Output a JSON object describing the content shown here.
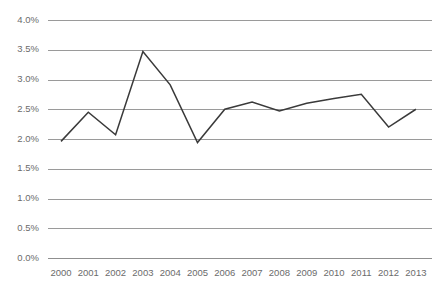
{
  "chart_data": {
    "type": "line",
    "title": "",
    "subtitle": "",
    "xlabel": "",
    "ylabel": "",
    "grid": true,
    "legend": false,
    "legend_position": "none",
    "line_color": "#3a3a3a",
    "grid_color": "#9a9a9a",
    "tick_label_color": "#6b6b6b",
    "background_color": "#ffffff",
    "categories": [
      "2000",
      "2001",
      "2002",
      "2003",
      "2004",
      "2005",
      "2006",
      "2007",
      "2008",
      "2009",
      "2010",
      "2011",
      "2012",
      "2013"
    ],
    "x": [
      2000,
      2001,
      2002,
      2003,
      2004,
      2005,
      2006,
      2007,
      2008,
      2009,
      2010,
      2011,
      2012,
      2013
    ],
    "values": [
      1.96,
      2.45,
      2.07,
      3.47,
      2.91,
      1.94,
      2.5,
      2.62,
      2.47,
      2.6,
      2.68,
      2.75,
      2.2,
      2.5
    ],
    "value_labels": [
      "2.0%",
      "2.5%",
      "2.1%",
      "3.5%",
      "2.9%",
      "1.9%",
      "2.5%",
      "2.6%",
      "2.5%",
      "2.6%",
      "2.7%",
      "2.8%",
      "2.2%",
      "2.5%"
    ],
    "ylim": [
      0.0,
      4.0
    ],
    "yticks": [
      0.0,
      0.5,
      1.0,
      1.5,
      2.0,
      2.5,
      3.0,
      3.5,
      4.0
    ],
    "ytick_labels": [
      "0.0%",
      "0.5%",
      "1.0%",
      "1.5%",
      "2.0%",
      "2.5%",
      "3.0%",
      "3.5%",
      "4.0%"
    ],
    "xtick_labels": [
      "2000",
      "2001",
      "2002",
      "2003",
      "2004",
      "2005",
      "2006",
      "2007",
      "2008",
      "2009",
      "2010",
      "2011",
      "2012",
      "2013"
    ],
    "series": [
      {
        "name": "",
        "values": [
          1.96,
          2.45,
          2.07,
          3.47,
          2.91,
          1.94,
          2.5,
          2.62,
          2.47,
          2.6,
          2.68,
          2.75,
          2.2,
          2.5
        ]
      }
    ]
  },
  "layout": {
    "plot_left": 48,
    "plot_right": 432,
    "plot_top": 20,
    "plot_bottom": 258,
    "first_point_x": 61,
    "point_spacing": 27.3
  }
}
